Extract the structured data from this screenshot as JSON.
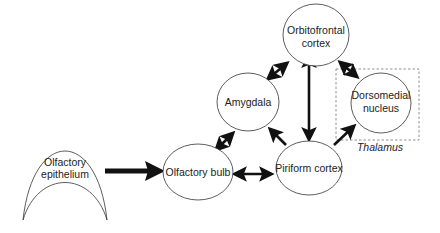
{
  "diagram": {
    "title": "",
    "colors": {
      "node_stroke": "#333333",
      "node_fill": "#ffffff",
      "arrow": "#111111",
      "group_stroke": "#777777",
      "text": "#222222"
    },
    "nodes": {
      "orbitofrontal": {
        "line1": "Orbitofrontal",
        "line2": "cortex"
      },
      "amygdala": {
        "line1": "Amygdala"
      },
      "dorsomedial": {
        "line1": "Dorsomedial",
        "line2": "nucleus"
      },
      "olfactory_bulb": {
        "line1": "Olfactory bulb"
      },
      "piriform": {
        "line1": "Piriform cortex"
      },
      "epithelium": {
        "line1": "Olfactory",
        "line2": "epithelium"
      }
    },
    "groups": {
      "thalamus": {
        "label": "Thalamus",
        "contains": [
          "dorsomedial"
        ]
      }
    },
    "edges": [
      {
        "from": "Olfactory epithelium",
        "to": "Olfactory bulb",
        "direction": "forward",
        "style": "thick"
      },
      {
        "from": "Olfactory bulb",
        "to": "Piriform cortex",
        "direction": "bidirectional"
      },
      {
        "from": "Olfactory bulb",
        "to": "Amygdala",
        "direction": "bidirectional"
      },
      {
        "from": "Amygdala",
        "to": "Orbitofrontal cortex",
        "direction": "bidirectional"
      },
      {
        "from": "Piriform cortex",
        "to": "Amygdala",
        "direction": "forward"
      },
      {
        "from": "Piriform cortex",
        "to": "Orbitofrontal cortex",
        "direction": "bidirectional"
      },
      {
        "from": "Orbitofrontal cortex",
        "to": "Dorsomedial nucleus",
        "direction": "bidirectional"
      },
      {
        "from": "Piriform cortex",
        "to": "Dorsomedial nucleus",
        "direction": "forward"
      }
    ]
  }
}
